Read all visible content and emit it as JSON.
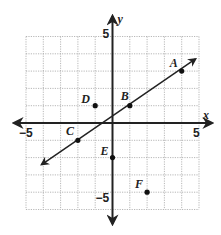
{
  "graph": {
    "x_axis_label": "x",
    "y_axis_label": "y",
    "x_range": [
      -5,
      5
    ],
    "y_range": [
      -5,
      5
    ],
    "tick_labels": {
      "x_min": "−5",
      "x_max": "5",
      "y_min": "−5",
      "y_max": "5"
    },
    "points": [
      {
        "label": "A",
        "x": 4,
        "y": 3
      },
      {
        "label": "B",
        "x": 1,
        "y": 1
      },
      {
        "label": "C",
        "x": -2,
        "y": -1
      },
      {
        "label": "D",
        "x": -1,
        "y": 1
      },
      {
        "label": "E",
        "x": 0,
        "y": -2
      },
      {
        "label": "F",
        "x": 2,
        "y": -4
      }
    ],
    "line": {
      "through": [
        "A",
        "B",
        "C"
      ],
      "slope": "2/3",
      "from": {
        "x": -4.1,
        "y": -2.4
      },
      "to": {
        "x": 4.8,
        "y": 3.7
      }
    }
  },
  "chart_data": {
    "type": "scatter",
    "title": "",
    "xlabel": "x",
    "ylabel": "y",
    "xlim": [
      -5,
      5
    ],
    "ylim": [
      -5,
      5
    ],
    "grid": true,
    "series": [
      {
        "name": "points",
        "x": [
          4,
          1,
          -2,
          -1,
          0,
          2
        ],
        "y": [
          3,
          1,
          -1,
          1,
          -2,
          -4
        ],
        "labels": [
          "A",
          "B",
          "C",
          "D",
          "E",
          "F"
        ]
      },
      {
        "name": "line",
        "type": "line",
        "x": [
          -4.1,
          4.8
        ],
        "y": [
          -2.4,
          3.7
        ]
      }
    ]
  }
}
